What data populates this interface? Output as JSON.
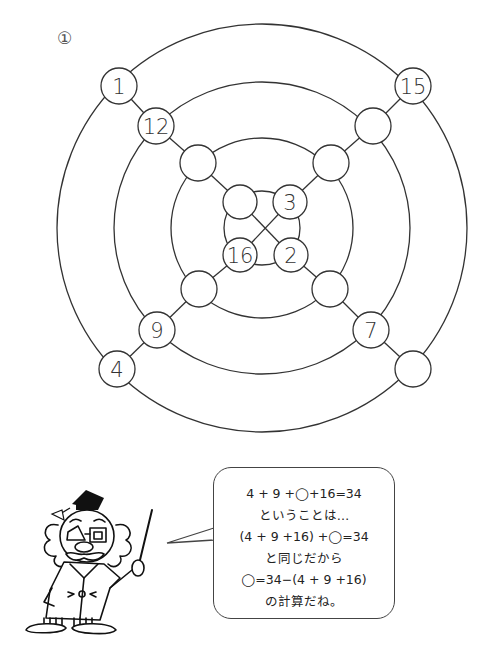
{
  "problem": {
    "number_label": "①"
  },
  "diagram": {
    "center": [
      262,
      228
    ],
    "rings": [
      {
        "name": "outer",
        "rx": 205,
        "ry": 204
      },
      {
        "name": "second",
        "rx": 148,
        "ry": 146
      },
      {
        "name": "third",
        "rx": 91,
        "ry": 90
      },
      {
        "name": "inner",
        "rx": 38,
        "ry": 37
      }
    ],
    "nodes": [
      {
        "id": "n-ul1",
        "x": 119,
        "y": 86,
        "r": 18,
        "value": "1"
      },
      {
        "id": "n-ur1",
        "x": 413,
        "y": 86,
        "r": 18,
        "value": "15"
      },
      {
        "id": "n-ul2",
        "x": 156,
        "y": 126,
        "r": 18,
        "value": "12"
      },
      {
        "id": "n-ur2",
        "x": 373,
        "y": 126,
        "r": 18,
        "value": ""
      },
      {
        "id": "n-ul3",
        "x": 198,
        "y": 163,
        "r": 18,
        "value": ""
      },
      {
        "id": "n-ur3",
        "x": 331,
        "y": 163,
        "r": 18,
        "value": ""
      },
      {
        "id": "n-ul4",
        "x": 240,
        "y": 202,
        "r": 17,
        "value": ""
      },
      {
        "id": "n-ur4",
        "x": 290,
        "y": 202,
        "r": 17,
        "value": "3"
      },
      {
        "id": "n-ll4",
        "x": 240,
        "y": 255,
        "r": 17,
        "value": "16"
      },
      {
        "id": "n-lr4",
        "x": 291,
        "y": 255,
        "r": 17,
        "value": "2"
      },
      {
        "id": "n-ll3",
        "x": 199,
        "y": 289,
        "r": 18,
        "value": ""
      },
      {
        "id": "n-lr3",
        "x": 330,
        "y": 289,
        "r": 18,
        "value": ""
      },
      {
        "id": "n-ll2",
        "x": 157,
        "y": 330,
        "r": 18,
        "value": "9"
      },
      {
        "id": "n-lr2",
        "x": 371,
        "y": 330,
        "r": 18,
        "value": "7"
      },
      {
        "id": "n-ll1",
        "x": 117,
        "y": 369,
        "r": 18,
        "value": "4"
      },
      {
        "id": "n-lr1",
        "x": 413,
        "y": 369,
        "r": 18,
        "value": ""
      }
    ],
    "diagonals": [
      [
        "n-ul1",
        "n-ul2",
        "n-ul3",
        "n-ul4",
        "n-lr4",
        "n-lr3",
        "n-lr2",
        "n-lr1"
      ],
      [
        "n-ur1",
        "n-ur2",
        "n-ur3",
        "n-ur4",
        "n-ll4",
        "n-ll3",
        "n-ll2",
        "n-ll1"
      ]
    ]
  },
  "speech_bubble": {
    "lines": [
      "4 + 9 +◯+16=34",
      "ということは…",
      "(4 + 9 +16) +◯=34",
      "と同じだから",
      "◯=34−(4 + 9 +16)",
      "の計算だね。"
    ]
  },
  "character": {
    "description": "professor with mortarboard cap, glasses and pointer"
  }
}
